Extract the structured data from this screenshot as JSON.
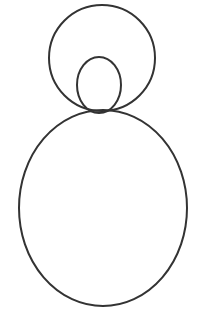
{
  "figure": {
    "width": 200,
    "height": 323,
    "background": "#ffffff",
    "stroke_color": "#333333",
    "stroke_width": 2,
    "shapes": [
      {
        "name": "outer-head-circle",
        "cx": 102,
        "cy": 58,
        "rx": 53,
        "ry": 53
      },
      {
        "name": "inner-head-ellipse",
        "cx": 99,
        "cy": 85,
        "rx": 22,
        "ry": 28
      },
      {
        "name": "body-ellipse",
        "cx": 103,
        "cy": 208,
        "rx": 84,
        "ry": 98
      }
    ]
  }
}
